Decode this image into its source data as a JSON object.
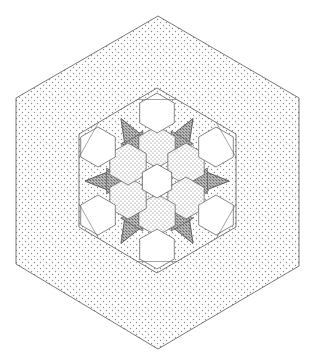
{
  "colors": {
    "background": "#ffffff",
    "line": "#555555",
    "dot": "#8a8a8a",
    "dense_dot": "#555555",
    "white_patch": "#ffffff"
  },
  "geometry": {
    "center": [
      157,
      181
    ],
    "outer_hex": {
      "points": [
        [
          158,
          16
        ],
        [
          299,
          98
        ],
        [
          299,
          266
        ],
        [
          158,
          349
        ],
        [
          16,
          264
        ],
        [
          16,
          98
        ]
      ],
      "fill": "dotted"
    },
    "inner_hex": {
      "points": [
        [
          157,
          88
        ],
        [
          236,
          134
        ],
        [
          236,
          227
        ],
        [
          157,
          273
        ],
        [
          79,
          227
        ],
        [
          79,
          134
        ]
      ],
      "fill": "dotted"
    },
    "center_white_hex": {
      "center": [
        157,
        181
      ],
      "radius": 17
    },
    "ring_white_hexes": [
      {
        "center": [
          157,
          113
        ],
        "radius": 20
      },
      {
        "center": [
          216,
          147
        ],
        "radius": 20
      },
      {
        "center": [
          216,
          215
        ],
        "radius": 20
      },
      {
        "center": [
          157,
          249
        ],
        "radius": 20
      },
      {
        "center": [
          98,
          215
        ],
        "radius": 20
      },
      {
        "center": [
          98,
          147
        ],
        "radius": 20
      }
    ],
    "dotted_hexes": [
      {
        "center": [
          157,
          147
        ],
        "radius": 17
      },
      {
        "center": [
          186,
          164
        ],
        "radius": 17
      },
      {
        "center": [
          186,
          198
        ],
        "radius": 17
      },
      {
        "center": [
          157,
          215
        ],
        "radius": 17
      },
      {
        "center": [
          128,
          198
        ],
        "radius": 17
      },
      {
        "center": [
          128,
          164
        ],
        "radius": 17
      }
    ]
  }
}
